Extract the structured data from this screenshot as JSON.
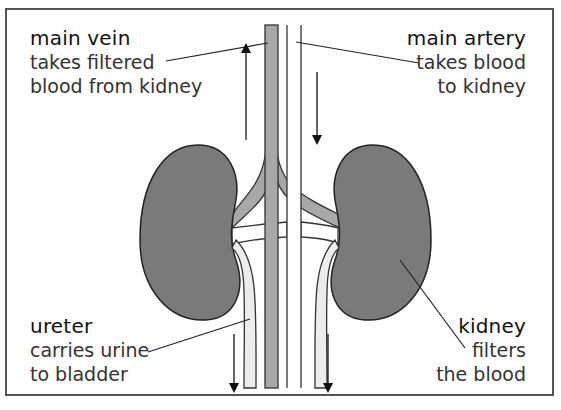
{
  "diagram": {
    "labels": {
      "vein": {
        "title": "main vein",
        "line1": "takes filtered",
        "line2": "blood from kidney"
      },
      "artery": {
        "title": "main artery",
        "line1": "takes blood",
        "line2": "to kidney"
      },
      "ureter": {
        "title": "ureter",
        "line1": "carries urine",
        "line2": "to bladder"
      },
      "kidney": {
        "title": "kidney",
        "line1": "filters",
        "line2": "the blood"
      }
    },
    "flow_arrows": [
      {
        "name": "vein-flow",
        "direction": "up"
      },
      {
        "name": "artery-flow",
        "direction": "down"
      },
      {
        "name": "left-ureter-flow",
        "direction": "down"
      },
      {
        "name": "right-ureter-flow",
        "direction": "down"
      }
    ],
    "colors": {
      "kidney_fill": "#7a7a7a",
      "vein_fill": "#a8a8a8",
      "ureter_fill": "#ececec",
      "outline": "#333333",
      "frame": "#555555"
    }
  }
}
